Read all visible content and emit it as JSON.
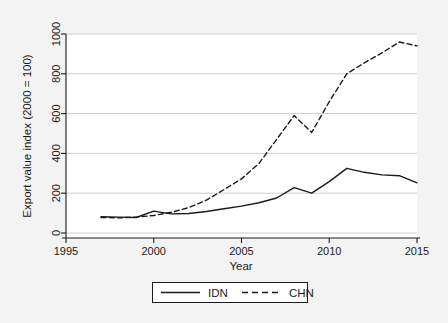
{
  "chart_data": {
    "type": "line",
    "title": "",
    "xlabel": "Year",
    "ylabel": "Export value index (2000 = 100)",
    "xlim": [
      1995,
      2015
    ],
    "ylim": [
      0,
      1000
    ],
    "xticks": [
      1995,
      2000,
      2005,
      2010,
      2015
    ],
    "yticks": [
      0,
      200,
      400,
      600,
      800,
      1000
    ],
    "grid": "horizontal",
    "legend_position": "below-center",
    "x": [
      1997,
      1998,
      1999,
      2000,
      2001,
      2002,
      2003,
      2004,
      2005,
      2006,
      2007,
      2008,
      2009,
      2010,
      2011,
      2012,
      2013,
      2014,
      2015
    ],
    "series": [
      {
        "name": "IDN",
        "style": "solid",
        "color": "#1a1a1a",
        "values": [
          82,
          80,
          78,
          110,
          96,
          98,
          108,
          122,
          135,
          152,
          176,
          228,
          200,
          258,
          325,
          305,
          292,
          288,
          252
        ]
      },
      {
        "name": "CHN",
        "style": "dashed",
        "color": "#1a1a1a",
        "values": [
          78,
          76,
          80,
          88,
          104,
          128,
          165,
          218,
          272,
          350,
          470,
          590,
          505,
          660,
          800,
          855,
          905,
          960,
          940
        ]
      }
    ]
  },
  "axes": {
    "ylabel": "Export value index (2000 = 100)",
    "xlabel": "Year",
    "ytick_labels": [
      "0",
      "200",
      "400",
      "600",
      "800",
      "1000"
    ],
    "xtick_labels": [
      "1995",
      "2000",
      "2005",
      "2010",
      "2015"
    ]
  },
  "legend": {
    "entries": [
      {
        "label": "IDN",
        "style": "solid"
      },
      {
        "label": "CHN",
        "style": "dashed"
      }
    ]
  },
  "colors": {
    "background": "#f3f3f3",
    "plot_background": "#ffffff",
    "gridline": "#c8c8c8",
    "axis": "#1a1a1a",
    "series": "#1a1a1a"
  }
}
